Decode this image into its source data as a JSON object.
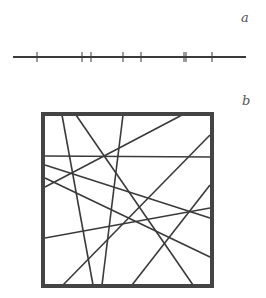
{
  "panels": {
    "a": {
      "label": "a",
      "label_pos": [
        241,
        11
      ]
    },
    "b": {
      "label": "b",
      "label_pos": [
        242,
        94
      ]
    }
  },
  "colors": {
    "line": "#3a3a3a",
    "frame": "#444444",
    "background": "#ffffff"
  },
  "panel_a": {
    "line": {
      "x1": 13,
      "x2": 246,
      "y": 57
    },
    "tick_half_height": 5,
    "ticks_x": [
      37,
      82,
      91,
      123,
      141,
      184,
      186,
      212
    ]
  },
  "panel_b": {
    "square": {
      "x": 43,
      "y": 114,
      "w": 169,
      "h": 172,
      "stroke": 4
    },
    "segments": [
      [
        62,
        115,
        93,
        285
      ],
      [
        76,
        115,
        193,
        285
      ],
      [
        123,
        115,
        102,
        285
      ],
      [
        182,
        115,
        45,
        187
      ],
      [
        45,
        156,
        210,
        157
      ],
      [
        45,
        165,
        210,
        218
      ],
      [
        45,
        178,
        210,
        257
      ],
      [
        210,
        135,
        63,
        285
      ],
      [
        210,
        185,
        132,
        285
      ],
      [
        45,
        238,
        210,
        208
      ]
    ]
  }
}
